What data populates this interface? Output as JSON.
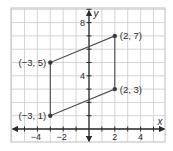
{
  "chart_data": {
    "type": "scatter",
    "title": "",
    "xlabel": "x",
    "ylabel": "y",
    "xlim": [
      -6,
      6
    ],
    "ylim": [
      -1,
      9.5
    ],
    "grid": true,
    "x_ticks": [
      {
        "value": -4,
        "label": "−4"
      },
      {
        "value": -2,
        "label": "−2"
      },
      {
        "value": 2,
        "label": "2"
      },
      {
        "value": 4,
        "label": "4"
      }
    ],
    "y_ticks": [
      {
        "value": 4,
        "label": "4"
      },
      {
        "value": 8,
        "label": "8"
      }
    ],
    "points": [
      {
        "x": -3,
        "y": 1,
        "label": "(−3, 1)",
        "label_pos": "left"
      },
      {
        "x": -3,
        "y": 5,
        "label": "(−3, 5)",
        "label_pos": "left"
      },
      {
        "x": 2,
        "y": 7,
        "label": "(2, 7)",
        "label_pos": "right"
      },
      {
        "x": 2,
        "y": 3,
        "label": "(2, 3)",
        "label_pos": "right"
      }
    ],
    "polygon": {
      "name": "parallelogram",
      "vertices": [
        [
          -3,
          1
        ],
        [
          -3,
          5
        ],
        [
          2,
          7
        ],
        [
          2,
          3
        ]
      ]
    },
    "colors": {
      "grid": "#c9c9c9",
      "grid_border": "#bdbdbd",
      "axis": "#2a2a2a",
      "shape": "#4a4a4a",
      "point": "#3a3a3a",
      "text": "#2a2a2a"
    }
  }
}
